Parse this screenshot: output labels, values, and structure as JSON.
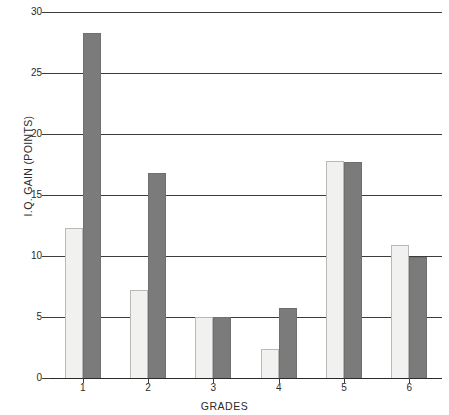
{
  "chart_data": {
    "type": "bar",
    "title": "",
    "xlabel": "GRADES",
    "ylabel": "I.Q. GAIN (POINTS)",
    "categories": [
      "1",
      "2",
      "3",
      "4",
      "5",
      "6"
    ],
    "ylim": [
      0,
      30
    ],
    "yticks": [
      0,
      5,
      10,
      15,
      20,
      25,
      30
    ],
    "ytick_labels": [
      "0",
      "5",
      "10",
      "15",
      "20",
      "25",
      "30"
    ],
    "grid": true,
    "legend": "none",
    "series": [
      {
        "name": "light-series",
        "color": "#f1f1ef",
        "values": [
          12.3,
          7.2,
          5.0,
          2.4,
          17.8,
          10.9
        ]
      },
      {
        "name": "dark-series",
        "color": "#7b7b7b",
        "values": [
          28.3,
          16.8,
          5.0,
          5.7,
          17.7,
          9.9
        ]
      }
    ]
  },
  "axes": {
    "y_title": "I.Q. GAIN (POINTS)",
    "x_title": "GRADES"
  },
  "colors": {
    "light_bar": "#f1f1ef",
    "dark_bar": "#7b7b7b",
    "gridline": "#3c3c3c",
    "background": "#ffffff",
    "text": "#2b2b2b"
  }
}
